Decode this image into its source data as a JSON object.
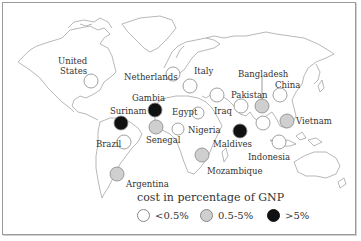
{
  "map": {
    "title": "cost in percentage of GNP",
    "colors": {
      "low": "#ffffff",
      "mid": "#cfcfcf",
      "high": "#111111",
      "stroke": "#888888",
      "coast": "#9a9a9a"
    }
  },
  "countries": [
    {
      "name": "United States",
      "category": "low"
    },
    {
      "name": "Netherlands",
      "category": "low"
    },
    {
      "name": "Italy",
      "category": "low"
    },
    {
      "name": "Gambia",
      "category": "high"
    },
    {
      "name": "Surinam",
      "category": "high"
    },
    {
      "name": "Egypt",
      "category": "low"
    },
    {
      "name": "Senegal",
      "category": "mid"
    },
    {
      "name": "Nigeria",
      "category": "low"
    },
    {
      "name": "Brazil",
      "category": "low"
    },
    {
      "name": "Argentina",
      "category": "mid"
    },
    {
      "name": "Iraq",
      "category": "low"
    },
    {
      "name": "Pakistan",
      "category": "low"
    },
    {
      "name": "Bangladesh",
      "category": "mid"
    },
    {
      "name": "China",
      "category": "low"
    },
    {
      "name": "Vietnam",
      "category": "mid"
    },
    {
      "name": "Maldives",
      "category": "high"
    },
    {
      "name": "Indonesia",
      "category": "low"
    },
    {
      "name": "Mozambique",
      "category": "mid"
    }
  ],
  "labels": {
    "united_states_1": "United",
    "united_states_2": "States",
    "netherlands": "Netherlands",
    "italy": "Italy",
    "gambia": "Gambia",
    "surinam": "Surinam",
    "egypt": "Egypt",
    "senegal": "Senegal",
    "nigeria": "Nigeria",
    "brazil": "Brazil",
    "argentina": "Argentina",
    "iraq": "Iraq",
    "pakistan": "Pakistan",
    "bangladesh": "Bangladesh",
    "china": "China",
    "vietnam": "Vietnam",
    "maldives": "Maldives",
    "indonesia": "Indonesia",
    "mozambique": "Mozambique"
  },
  "legend": {
    "title": "cost in percentage of GNP",
    "items": [
      {
        "label": "<0.5%",
        "category": "low"
      },
      {
        "label": "0.5-5%",
        "category": "mid"
      },
      {
        "label": ">5%",
        "category": "high"
      }
    ]
  }
}
